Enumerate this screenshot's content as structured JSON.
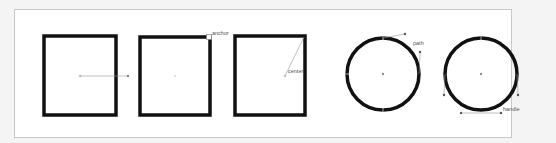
{
  "diagram": {
    "background": "#ffffff",
    "frame_border_color": "#c8c8c8",
    "stroke_color": "#111111",
    "guide_color": "#888888",
    "shapes": [
      {
        "id": "square-1",
        "type": "square",
        "annotation": ""
      },
      {
        "id": "square-2",
        "type": "square",
        "annotation": "anchor"
      },
      {
        "id": "square-3",
        "type": "square",
        "annotation": "center"
      },
      {
        "id": "circle-1",
        "type": "circle",
        "annotation": "path"
      },
      {
        "id": "circle-2",
        "type": "circle",
        "annotation": "handle"
      }
    ],
    "labels": {
      "anchor": "anchor",
      "center": "center",
      "path": "path",
      "handle": "handle"
    }
  }
}
